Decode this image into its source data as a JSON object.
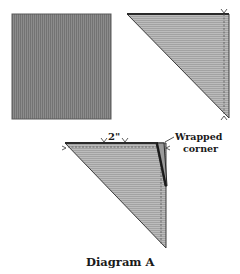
{
  "diagram": {
    "caption": "Diagram A",
    "panels": [
      {
        "name": "fabric-square",
        "description": "square of fabric"
      },
      {
        "name": "folded-triangle",
        "description": "square folded in half diagonally with stitch line"
      },
      {
        "name": "wrapped-corner-triangle",
        "description": "triangle with wrapped corner"
      }
    ],
    "measurement_label": "2\"",
    "callout_label_line1": "Wrapped",
    "callout_label_line2": "corner"
  },
  "colors": {
    "fabric_fill": "#8a8a8a",
    "fabric_light_fill": "#b4b4b4",
    "stroke": "#2a2a2a",
    "text": "#1a1a1a"
  }
}
